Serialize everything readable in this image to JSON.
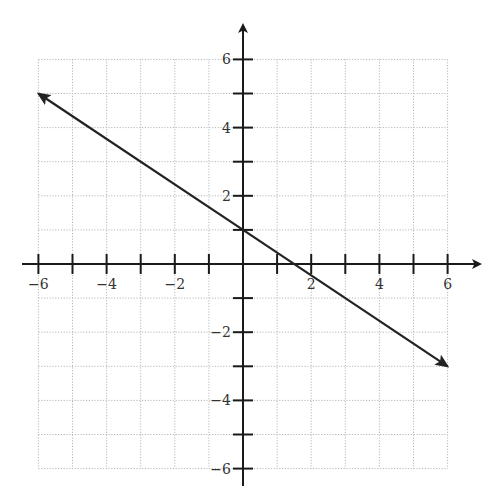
{
  "chart_data": {
    "type": "line",
    "title": "",
    "xlabel": "",
    "ylabel": "",
    "xlim": [
      -6,
      6
    ],
    "ylim": [
      -6,
      6
    ],
    "grid": true,
    "grid_style": "dotted",
    "x_tick_labels": [
      "-6",
      "-4",
      "-2",
      "2",
      "4",
      "6"
    ],
    "y_tick_labels": [
      "6",
      "4",
      "2",
      "-2",
      "-4",
      "-6"
    ],
    "x_ticks": [
      -6,
      -5,
      -4,
      -3,
      -2,
      -1,
      1,
      2,
      3,
      4,
      5,
      6
    ],
    "y_ticks": [
      6,
      5,
      4,
      3,
      2,
      1,
      -1,
      -2,
      -3,
      -4,
      -5,
      -6
    ],
    "series": [
      {
        "name": "line",
        "equation": "y = -2/3 x + 1",
        "slope": -0.6667,
        "y_intercept": 1,
        "x_intercept": 1.5,
        "x": [
          -6,
          6
        ],
        "y": [
          5,
          -3
        ],
        "arrows": "both ends"
      }
    ],
    "legend": "none",
    "colors": {
      "axis": "#1a1a1a",
      "grid": "#b8b8b8",
      "line": "#222222"
    }
  }
}
